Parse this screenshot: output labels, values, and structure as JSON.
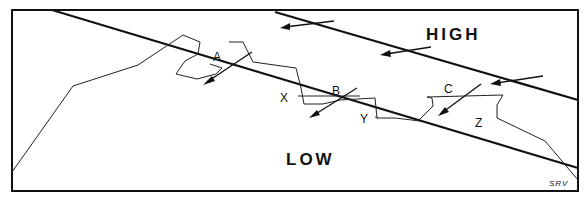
{
  "diagram": {
    "regions": {
      "high_label": "HIGH",
      "low_label": "LOW"
    },
    "points": [
      {
        "label": "A"
      },
      {
        "label": "B"
      },
      {
        "label": "C"
      }
    ],
    "zones": [
      {
        "label": "X"
      },
      {
        "label": "Y"
      },
      {
        "label": "Z"
      }
    ],
    "signature": "SRV",
    "colors": {
      "line": "#111111",
      "background": "#ffffff"
    }
  }
}
